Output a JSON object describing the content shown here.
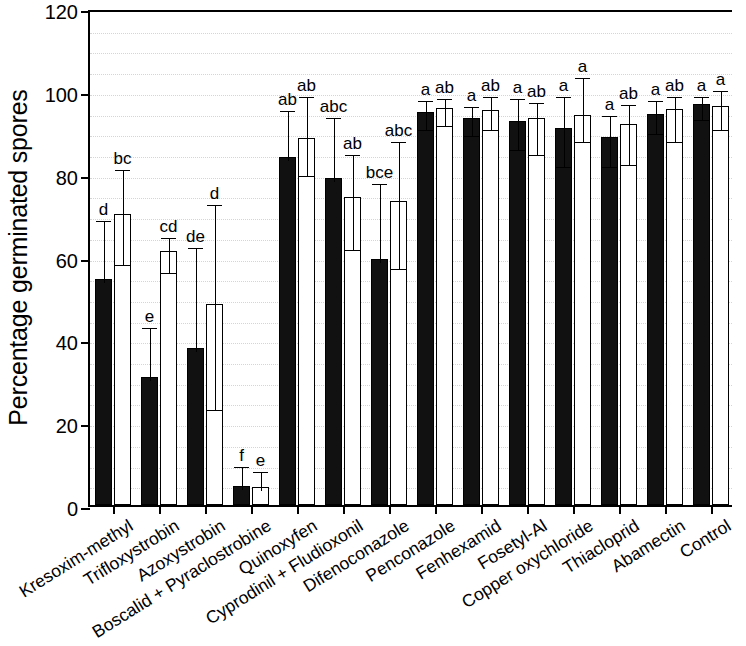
{
  "chart_data": {
    "type": "bar",
    "title": "",
    "subtitle": "",
    "xlabel": "",
    "ylabel": "Percentage germinated spores",
    "ylim": [
      0,
      120
    ],
    "yticks": [
      0,
      20,
      40,
      60,
      80,
      100,
      120
    ],
    "grid": true,
    "legend": "none",
    "orientation": "vertical",
    "categories": [
      "Kresoxim-methyl",
      "Trifloxystrobin",
      "Azoxystrobin",
      "Boscalid + Pyraclostrobine",
      "Quinoxyfen",
      "Cyprodinil + Fludioxonil",
      "Difenoconazole",
      "Penconazole",
      "Fenhexamid",
      "Fosetyl-Al",
      "Copper oxychloride",
      "Thiacloprid",
      "Abamectin",
      "Control"
    ],
    "series": [
      {
        "name": "filled",
        "fill": "#111111",
        "values": [
          54.5,
          30.8,
          38.0,
          4.6,
          84.0,
          79.0,
          59.5,
          95.0,
          93.5,
          92.8,
          91.0,
          88.8,
          94.5,
          96.8
        ],
        "err_upper": [
          69.5,
          43.8,
          63.0,
          10.2,
          96.0,
          94.5,
          78.5,
          98.5,
          97.0,
          99.0,
          99.5,
          95.0,
          98.5,
          99.5
        ],
        "err_lower": [
          54.5,
          30.8,
          38.0,
          4.6,
          84.0,
          79.0,
          59.5,
          91.5,
          90.0,
          86.6,
          82.5,
          82.5,
          90.5,
          94.0
        ],
        "sig_letters": [
          "d",
          "e",
          "de",
          "f",
          "ab",
          "abc",
          "bce",
          "a",
          "a",
          "a",
          "a",
          "a",
          "a",
          "a"
        ]
      },
      {
        "name": "open",
        "fill": "#ffffff",
        "values": [
          70.3,
          61.3,
          48.6,
          4.4,
          88.5,
          74.3,
          73.5,
          95.8,
          95.3,
          93.5,
          94.2,
          92.0,
          95.5,
          96.3
        ],
        "err_upper": [
          81.8,
          65.5,
          73.5,
          9.0,
          99.5,
          85.5,
          88.5,
          99.0,
          99.5,
          98.0,
          104.0,
          97.5,
          99.5,
          101.0
        ],
        "err_lower": [
          58.8,
          57.0,
          24.0,
          4.4,
          80.5,
          62.5,
          58.0,
          92.5,
          91.5,
          85.5,
          88.5,
          83.0,
          88.5,
          91.5
        ],
        "sig_letters": [
          "bc",
          "cd",
          "d",
          "e",
          "ab",
          "ab",
          "abc",
          "ab",
          "ab",
          "ab",
          "a",
          "ab",
          "ab",
          "a"
        ]
      }
    ]
  },
  "axis": {
    "y_title": "Percentage germinated spores",
    "y_tick_labels": [
      "0",
      "20",
      "40",
      "60",
      "80",
      "100",
      "120"
    ]
  }
}
